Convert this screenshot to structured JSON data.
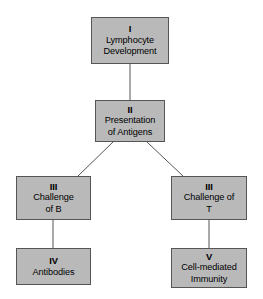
{
  "diagram": {
    "colors": {
      "background": "#ffffff",
      "node_fill": "#b9b9b9",
      "node_border": "#555555",
      "connector": "#555555",
      "text": "#000000"
    },
    "nodes": [
      {
        "id": "lymphocyte-development",
        "numeral": "I",
        "lines": [
          "Lymphocyte",
          "Development"
        ]
      },
      {
        "id": "presentation-of-antigens",
        "numeral": "II",
        "lines": [
          "Presentation",
          "of Antigens"
        ]
      },
      {
        "id": "challenge-of-b",
        "numeral": "III",
        "lines": [
          "Challenge",
          "of B"
        ]
      },
      {
        "id": "challenge-of-t",
        "numeral": "III",
        "lines": [
          "Challenge of",
          "T"
        ]
      },
      {
        "id": "antibodies",
        "numeral": "IV",
        "lines": [
          "Antibodies"
        ]
      },
      {
        "id": "cell-mediated-immunity",
        "numeral": "V",
        "lines": [
          "Cell-mediated",
          "Immunity"
        ]
      }
    ],
    "connectors": [
      {
        "id": "i-to-ii",
        "from": "lymphocyte-development",
        "to": "presentation-of-antigens",
        "kind": "vertical"
      },
      {
        "id": "ii-to-iii-b",
        "from": "presentation-of-antigens",
        "to": "challenge-of-b",
        "kind": "diagonal"
      },
      {
        "id": "ii-to-iii-t",
        "from": "presentation-of-antigens",
        "to": "challenge-of-t",
        "kind": "diagonal"
      },
      {
        "id": "iii-b-to-iv",
        "from": "challenge-of-b",
        "to": "antibodies",
        "kind": "vertical"
      },
      {
        "id": "iii-t-to-v",
        "from": "challenge-of-t",
        "to": "cell-mediated-immunity",
        "kind": "vertical"
      }
    ]
  }
}
